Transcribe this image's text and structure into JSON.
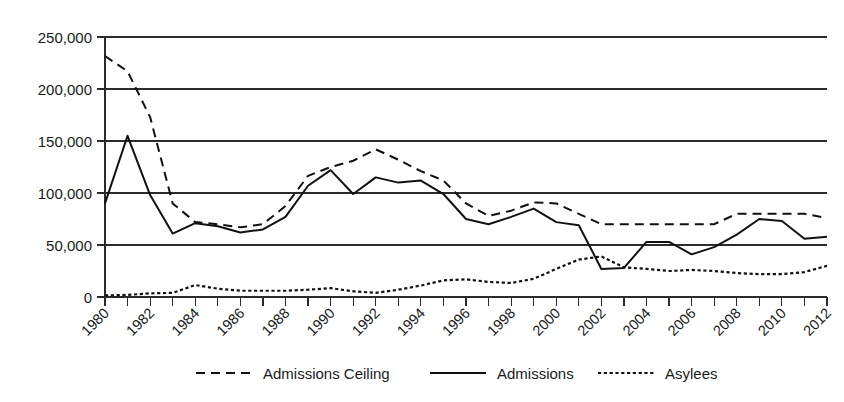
{
  "chart_data": {
    "type": "line",
    "title": "",
    "subtitle": "",
    "xlabel": "",
    "ylabel": "",
    "xlim": [
      1980,
      2012
    ],
    "ylim": [
      0,
      250000
    ],
    "grid": "horizontal",
    "legend_position": "bottom",
    "x": [
      1980,
      1981,
      1982,
      1983,
      1984,
      1985,
      1986,
      1987,
      1988,
      1989,
      1990,
      1991,
      1992,
      1993,
      1994,
      1995,
      1996,
      1997,
      1998,
      1999,
      2000,
      2001,
      2002,
      2003,
      2004,
      2005,
      2006,
      2007,
      2008,
      2009,
      2010,
      2011,
      2012
    ],
    "xtick_labels": [
      "1980",
      "1982",
      "1984",
      "1986",
      "1988",
      "1990",
      "1992",
      "1994",
      "1996",
      "1998",
      "2000",
      "2002",
      "2004",
      "2006",
      "2008",
      "2010",
      "2012"
    ],
    "xtick_values": [
      1980,
      1982,
      1984,
      1986,
      1988,
      1990,
      1992,
      1994,
      1996,
      1998,
      2000,
      2002,
      2004,
      2006,
      2008,
      2010,
      2012
    ],
    "ytick_labels": [
      "0",
      "50,000",
      "100,000",
      "150,000",
      "200,000",
      "250,000"
    ],
    "ytick_values": [
      0,
      50000,
      100000,
      150000,
      200000,
      250000
    ],
    "series": [
      {
        "name": "Admissions Ceiling",
        "style": "dashed",
        "color": "#111111",
        "values": [
          231700,
          217000,
          173000,
          90000,
          72000,
          70000,
          67000,
          70000,
          87500,
          116500,
          125000,
          131000,
          142000,
          132000,
          121000,
          112000,
          90000,
          78000,
          83000,
          91000,
          90000,
          80000,
          70000,
          70000,
          70000,
          70000,
          70000,
          70000,
          80000,
          80000,
          80000,
          80000,
          76000
        ]
      },
      {
        "name": "Admissions",
        "style": "solid",
        "color": "#111111",
        "values": [
          90000,
          155000,
          98000,
          61000,
          71000,
          68000,
          62000,
          65000,
          77000,
          107000,
          122000,
          99000,
          115000,
          110000,
          112000,
          99000,
          75000,
          70000,
          77000,
          85000,
          72000,
          69000,
          27000,
          28000,
          53000,
          53000,
          41000,
          48000,
          60000,
          75000,
          73000,
          56000,
          58000
        ]
      },
      {
        "name": "Asylees",
        "style": "dotted",
        "color": "#111111",
        "values": [
          1500,
          2000,
          3500,
          4000,
          11500,
          8000,
          6000,
          6000,
          6000,
          7000,
          8500,
          5500,
          4000,
          7000,
          11000,
          16000,
          17000,
          14500,
          13500,
          17500,
          27000,
          36000,
          39000,
          28500,
          27000,
          25000,
          26000,
          25000,
          23000,
          22000,
          22000,
          24000,
          30000
        ]
      }
    ]
  },
  "legend": {
    "items": [
      {
        "label": "Admissions Ceiling"
      },
      {
        "label": "Admissions"
      },
      {
        "label": "Asylees"
      }
    ]
  }
}
